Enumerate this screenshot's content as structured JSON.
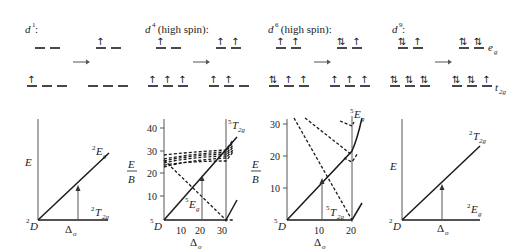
{
  "panels": [
    {
      "id": "d1",
      "config_label": "d",
      "config_sup": "1",
      "config_suffix": ":",
      "ground": {
        "eg": [
          "",
          ""
        ],
        "t2g": [
          "↑",
          "",
          ""
        ]
      },
      "excited": {
        "eg": [
          "↑",
          ""
        ],
        "t2g": [
          "",
          "",
          ""
        ]
      },
      "diagram": {
        "y_label": "E",
        "origin_term": "D",
        "origin_sup": "2",
        "upper_term": "E",
        "upper_sup": "2",
        "upper_sub": "g",
        "lower_term": "T",
        "lower_sup": "2",
        "lower_sub": "2g",
        "x_label": "Δ",
        "x_sub": "o"
      }
    },
    {
      "id": "d4",
      "config_label": "d",
      "config_sup": "4",
      "config_suffix": " (high spin):",
      "ground": {
        "eg": [
          "↑",
          ""
        ],
        "t2g": [
          "↑",
          "↑",
          "↑"
        ]
      },
      "excited": {
        "eg": [
          "↑",
          "↑"
        ],
        "t2g": [
          "↑",
          "↑",
          ""
        ]
      },
      "diagram": {
        "y_label": "E",
        "y_label_den": "B",
        "origin_term": "D",
        "origin_sup": "5",
        "upper_term": "T",
        "upper_sup": "5",
        "upper_sub": "2g",
        "lower_term": "E",
        "lower_sup": "5",
        "lower_sub": "g",
        "x_label": "Δ",
        "x_sub": "o",
        "y_ticks": [
          "10",
          "20",
          "30",
          "40"
        ],
        "x_ticks": [
          "10",
          "20",
          "30"
        ]
      }
    },
    {
      "id": "d6",
      "config_label": "d",
      "config_sup": "6",
      "config_suffix": " (high spin):",
      "ground": {
        "eg": [
          "↑",
          "↑"
        ],
        "t2g": [
          "⇅",
          "↑",
          "↑"
        ]
      },
      "excited": {
        "eg": [
          "⇅",
          "↑"
        ],
        "t2g": [
          "↑",
          "↑",
          "↑"
        ]
      },
      "diagram": {
        "y_label": "E",
        "y_label_den": "B",
        "origin_term": "D",
        "origin_sup": "5",
        "upper_term": "E",
        "upper_sup": "5",
        "upper_sub": "g",
        "lower_term": "T",
        "lower_sup": "5",
        "lower_sub": "2g",
        "x_label": "Δ",
        "x_sub": "o",
        "y_ticks": [
          "10",
          "20",
          "30"
        ],
        "x_ticks": [
          "10",
          "20"
        ]
      }
    },
    {
      "id": "d9",
      "config_label": "d",
      "config_sup": "9",
      "config_suffix": ":",
      "ground": {
        "eg": [
          "⇅",
          "↑"
        ],
        "t2g": [
          "⇅",
          "⇅",
          "⇅"
        ]
      },
      "excited": {
        "eg": [
          "⇅",
          "⇅"
        ],
        "t2g": [
          "⇅",
          "⇅",
          "↑"
        ]
      },
      "eg_label": "e",
      "eg_sub": "g",
      "t2g_label": "t",
      "t2g_sub": "2g",
      "diagram": {
        "y_label": "E",
        "origin_term": "D",
        "origin_sup": "2",
        "upper_term": "T",
        "upper_sup": "2",
        "upper_sub": "2g",
        "lower_term": "E",
        "lower_sup": "2",
        "lower_sub": "g",
        "x_label": "Δ",
        "x_sub": "o"
      }
    }
  ],
  "transition_arrow": "→",
  "colors": {
    "ink": "#1a1a1a",
    "background": "#ffffff",
    "transition_arrow": "#555555"
  }
}
